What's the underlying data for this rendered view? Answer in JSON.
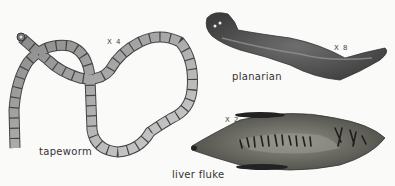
{
  "specimens": {
    "tapeworm": {
      "label": "tapeworm",
      "magnification": "X 4"
    },
    "planarian": {
      "label": "planarian",
      "magnification": "X 8"
    },
    "liver_fluke": {
      "label": "liver fluke",
      "magnification": "X 2"
    }
  },
  "colors": {
    "background": "#fafaf9",
    "worm_dark": "#3a3a3a",
    "worm_mid": "#7a7a7a",
    "tapeworm_light": "#c8c8c8"
  }
}
